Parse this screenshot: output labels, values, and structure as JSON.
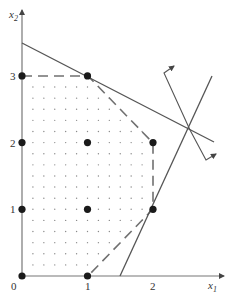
{
  "figure": {
    "type": "integer programming feasible region diagram",
    "axes": {
      "x_label": "x",
      "x_sub": "1",
      "y_label": "x",
      "y_sub": "2",
      "x_ticks": [
        "0",
        "1",
        "2"
      ],
      "y_ticks": [
        "1",
        "2",
        "3"
      ]
    },
    "integer_points": [
      [
        0,
        0
      ],
      [
        1,
        0
      ],
      [
        0,
        1
      ],
      [
        1,
        1
      ],
      [
        2,
        1
      ],
      [
        0,
        2
      ],
      [
        1,
        2
      ],
      [
        2,
        2
      ],
      [
        0,
        3
      ],
      [
        1,
        3
      ]
    ],
    "convex_hull_dashed": [
      [
        0,
        3
      ],
      [
        1,
        3
      ],
      [
        2,
        2
      ],
      [
        2,
        1
      ],
      [
        1,
        0
      ]
    ],
    "constraint_lines": [
      {
        "name": "constraint-1",
        "from": [
          0,
          3.45
        ],
        "to": [
          3.0,
          1.6
        ]
      },
      {
        "name": "constraint-2",
        "from": [
          1.5,
          0
        ],
        "to": [
          2.9,
          2.55
        ]
      }
    ],
    "lp_optimum_vertex": [
      2.6,
      1.75
    ],
    "normal_arrows": 2,
    "colors": {
      "line": "#555555",
      "dash": "#666666",
      "point": "#1a1a1a",
      "dot": "#888888"
    }
  }
}
